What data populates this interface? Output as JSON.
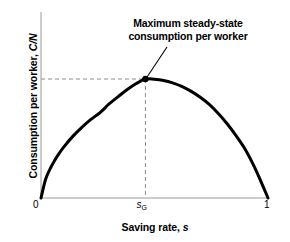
{
  "chart_data": {
    "type": "line",
    "title": "",
    "subtitle": "",
    "xlabel_text": "Saving rate, ",
    "xlabel_symbol": "s",
    "ylabel_text": "Consumption per worker, ",
    "ylabel_symbol": "C/N",
    "xlim": [
      0,
      1
    ],
    "ylim": [
      0,
      1.1
    ],
    "grid": false,
    "legend": "none",
    "x_tick_labels": [
      "0",
      "s_G",
      "1"
    ],
    "x_tick_values": [
      0,
      0.46,
      1
    ],
    "y_tick_labels": [],
    "annotations": [
      {
        "name": "peak-annotation",
        "text_line1": "Maximum steady-state",
        "text_line2": "consumption per worker",
        "points_to_x": 0.46,
        "points_to_y": 1.0
      }
    ],
    "markers": [
      {
        "name": "golden-rule-point",
        "x": 0.46,
        "y": 1.0
      }
    ],
    "guide_lines": [
      {
        "name": "horizontal-dashed-guide",
        "from": [
          0,
          1.0
        ],
        "to": [
          0.46,
          1.0
        ],
        "style": "dashed"
      },
      {
        "name": "vertical-dashed-guide",
        "from": [
          0.46,
          1.0
        ],
        "to": [
          0.46,
          0
        ],
        "style": "dashed"
      }
    ],
    "series": [
      {
        "name": "consumption-per-worker-curve",
        "color": "#000000",
        "x": [
          0.0,
          0.02,
          0.04,
          0.06,
          0.08,
          0.1,
          0.14,
          0.18,
          0.22,
          0.26,
          0.3,
          0.34,
          0.38,
          0.42,
          0.46,
          0.5,
          0.54,
          0.58,
          0.62,
          0.66,
          0.7,
          0.74,
          0.78,
          0.82,
          0.86,
          0.9,
          0.94,
          0.97,
          1.0
        ],
        "y": [
          0.0,
          0.155,
          0.245,
          0.315,
          0.375,
          0.428,
          0.518,
          0.594,
          0.66,
          0.718,
          0.79,
          0.852,
          0.912,
          0.962,
          1.0,
          0.998,
          0.988,
          0.968,
          0.938,
          0.898,
          0.848,
          0.788,
          0.712,
          0.624,
          0.522,
          0.408,
          0.262,
          0.134,
          0.0
        ]
      }
    ],
    "colors": {
      "curve": "#000000",
      "axis": "#9a9a9a",
      "guide": "#8c8c8c",
      "marker": "#000000",
      "leader": "#000000",
      "background": "#ffffff"
    }
  }
}
